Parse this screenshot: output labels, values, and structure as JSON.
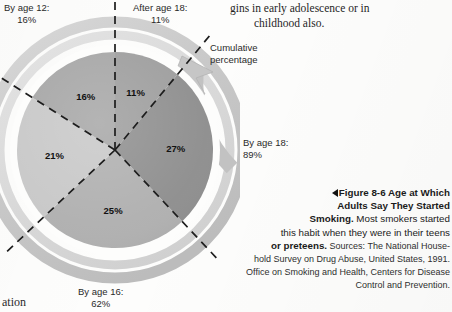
{
  "body_copy": {
    "line1": "gins in early adolescence or in",
    "line2": "childhood also."
  },
  "stray_text": "ation",
  "figure": {
    "cumulative_label_line1": "Cumulative",
    "cumulative_label_line2": "percentage",
    "callouts": [
      {
        "name": "by-age-12",
        "line1": "By age 12:",
        "line2": "16%"
      },
      {
        "name": "after-age-18",
        "line1": "After age 18:",
        "line2": "11%"
      },
      {
        "name": "by-age-18",
        "line1": "By age 18:",
        "line2": "89%"
      },
      {
        "name": "by-age-16",
        "line1": "By age 16:",
        "line2": "62%"
      }
    ]
  },
  "caption": {
    "marker": "",
    "title": "Figure 8-6  Age at Which Adults Say They Started Smoking.",
    "title_line1": "Figure 8-6  Age at Which",
    "title_line2": "Adults Say They Started",
    "title_line3": "Smoking.",
    "text_part1": " Most smokers started",
    "text_line2": "this habit when they were in their teens",
    "text_line3_bold": "or preteens.",
    "sources_line1": " Sources: The National House-",
    "sources_line2": "hold Survey on Drug Abuse, United States, 1991.",
    "sources_line3": "Office on Smoking and Health, Centers for Disease",
    "sources_line4": "Control and Prevention."
  },
  "colors": {
    "ring_outer": "#c9c9c9",
    "ring_inner": "#d8d8d8",
    "arrow": "#c2c2c2",
    "slice_11": "#9e9e9e",
    "slice_27": "#8f8f8f",
    "slice_25": "#b0b0b0",
    "slice_21": "#c8c8c8",
    "slice_16": "#a6a6a6",
    "dash": "#1d1d1d",
    "page_bg": "#fdfdfc"
  },
  "chart_data": {
    "type": "pie",
    "title": "Figure 8-6  Age at Which Adults Say They Started Smoking",
    "categories": [
      "After age 18",
      "By age 18",
      "By age 16",
      "Age 14-15",
      "By age 12"
    ],
    "labels": [
      "11%",
      "27%",
      "25%",
      "21%",
      "16%"
    ],
    "values": [
      11,
      27,
      25,
      21,
      16
    ],
    "units": "percent",
    "start_angle_deg": 0,
    "direction": "clockwise",
    "slice_order_from_12_oclock_clockwise": [
      {
        "label": "11%",
        "value": 11,
        "color": "#9e9e9e"
      },
      {
        "label": "27%",
        "value": 27,
        "color": "#8f8f8f"
      },
      {
        "label": "25%",
        "value": 25,
        "color": "#b0b0b0"
      },
      {
        "label": "21%",
        "value": 21,
        "color": "#c8c8c8"
      },
      {
        "label": "16%",
        "value": 16,
        "color": "#a6a6a6"
      }
    ],
    "cumulative_annotations": [
      {
        "label": "By age 12",
        "value": 16
      },
      {
        "label": "By age 16",
        "value": 62
      },
      {
        "label": "By age 18",
        "value": 89
      },
      {
        "label": "After age 18",
        "value": 11
      }
    ],
    "annotations": [
      "Cumulative percentage"
    ],
    "legend": "none",
    "grid": false
  }
}
